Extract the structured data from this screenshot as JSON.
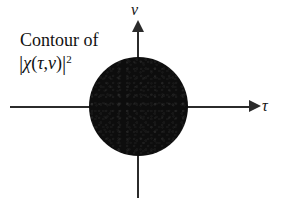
{
  "figure": {
    "background_color": "#ffffff",
    "ink_color": "#111111",
    "axis_color": "#2b2b2b",
    "blob_color": "#0d0d0d",
    "caption": {
      "line1": "Contour of",
      "magnitude_bar_open": "|",
      "chi_symbol": "χ",
      "paren_open": "(",
      "tau_symbol": "τ",
      "comma": ",",
      "nu_symbol": "ν",
      "paren_close": ")",
      "magnitude_bar_close": "|",
      "exponent": "2",
      "plain_text": "Contour of |χ(τ,ν)|²"
    },
    "axes": {
      "x_label": "τ",
      "y_label": "ν",
      "x_arrow_direction": "right",
      "y_arrow_direction": "up"
    }
  },
  "chart_data": {
    "type": "scatter",
    "xlabel": "τ",
    "ylabel": "ν",
    "grid": false,
    "legend": "none",
    "regions": [
      {
        "name": "main-lobe",
        "shape": "circle",
        "center": [
          0,
          0
        ],
        "radius_tau": 1.0,
        "radius_nu": 1.0,
        "fill": "solid-black"
      }
    ],
    "xlim": [
      -2.6,
      2.4
    ],
    "ylim": [
      -1.7,
      1.7
    ]
  }
}
